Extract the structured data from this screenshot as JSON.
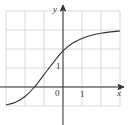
{
  "chart_data": {
    "type": "line",
    "title": "",
    "xlabel": "x",
    "ylabel": "y",
    "origin_label": "0",
    "x_tick_labels": [
      {
        "value": 1,
        "label": "1"
      }
    ],
    "y_tick_labels": [
      {
        "value": 1,
        "label": "1"
      }
    ],
    "xlim": [
      -3,
      3
    ],
    "ylim": [
      -1,
      4
    ],
    "grid": true,
    "grid_step": 1,
    "curve_description": "sigmoid-like increasing curve, crossing x-axis near x=-1.5, y-intercept about 2, approaching y≈3 on the right and y≈-1 on the left",
    "x": [
      -3,
      -2.5,
      -2,
      -1.5,
      -1,
      -0.5,
      0,
      0.5,
      1,
      1.5,
      2,
      2.5,
      3
    ],
    "y": [
      -0.95,
      -0.8,
      -0.5,
      0.0,
      0.65,
      1.3,
      1.9,
      2.3,
      2.55,
      2.72,
      2.83,
      2.9,
      2.95
    ],
    "colors": {
      "grid": "#cfcfcf",
      "axis": "#333333",
      "curve": "#333333"
    }
  },
  "labels": {
    "x_axis": "x",
    "y_axis": "y",
    "origin": "0",
    "x_tick_1": "1",
    "y_tick_1": "1"
  }
}
